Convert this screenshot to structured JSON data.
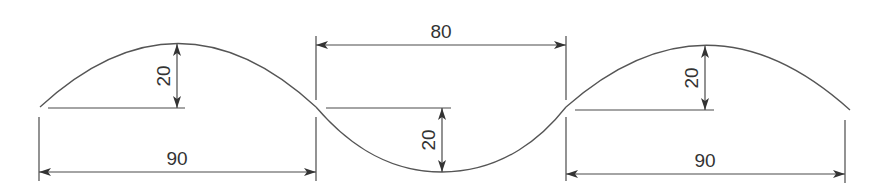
{
  "diagram": {
    "type": "engineering-dimension-drawing",
    "colors": {
      "line": "#4a4a4a",
      "curve": "#555555",
      "text": "#333333",
      "background": "#ffffff"
    },
    "dimensions": {
      "left_span": {
        "label": "90"
      },
      "left_height": {
        "label": "20"
      },
      "middle_span": {
        "label": "80"
      },
      "middle_depth": {
        "label": "20"
      },
      "right_span": {
        "label": "90"
      },
      "right_height": {
        "label": "20"
      }
    }
  }
}
